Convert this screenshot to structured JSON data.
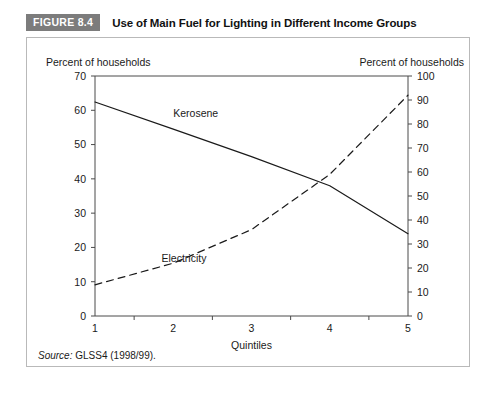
{
  "header": {
    "badge": "FIGURE 8.4",
    "title": "Use of Main Fuel for Lighting in Different Income Groups"
  },
  "source": {
    "keyword": "Source:",
    "text": "GLSS4 (1998/99)."
  },
  "chart_data": {
    "type": "line",
    "title": "Use of Main Fuel for Lighting in Different Income Groups",
    "xlabel": "Quintiles",
    "ylabel": "Percent of households",
    "y2label": "Percent of households",
    "x": [
      1,
      2,
      3,
      4,
      5
    ],
    "categories": [
      "1",
      "2",
      "3",
      "4",
      "5"
    ],
    "xticklabels": [
      "1",
      "2",
      "3",
      "4",
      "5"
    ],
    "ylim": [
      0,
      70
    ],
    "yticks": [
      0,
      10,
      20,
      30,
      40,
      50,
      60,
      70
    ],
    "yticklabels": [
      "0",
      "10",
      "20",
      "30",
      "40",
      "50",
      "60",
      "70"
    ],
    "y2lim": [
      0,
      100
    ],
    "y2ticks": [
      0,
      10,
      20,
      30,
      40,
      50,
      60,
      70,
      80,
      90,
      100
    ],
    "y2ticklabels": [
      "0",
      "10",
      "20",
      "30",
      "40",
      "50",
      "60",
      "70",
      "80",
      "90",
      "100"
    ],
    "grid": false,
    "legend": "inline-labels",
    "series": [
      {
        "name": "Kerosene",
        "axis": "left",
        "style": "solid",
        "color": "#1a1a1a",
        "values": [
          62.4,
          54.5,
          46.5,
          38.0,
          24.0
        ],
        "label_x": 2.0,
        "label_y": 58.0
      },
      {
        "name": "Electricity",
        "axis": "right",
        "style": "dashed",
        "color": "#1a1a1a",
        "values": [
          13.0,
          22.0,
          36.0,
          59.0,
          92.0
        ],
        "label_x": 1.85,
        "label_y": 22.5
      }
    ]
  }
}
